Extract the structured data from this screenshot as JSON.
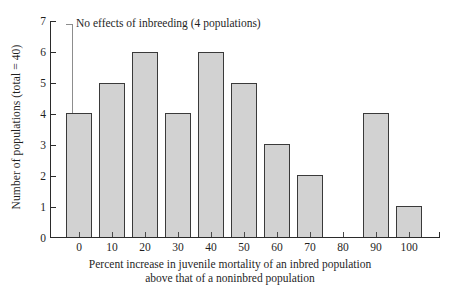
{
  "chart_data": {
    "type": "bar",
    "title": "",
    "subtitle": "",
    "xlabel_line1": "Percent increase in juvenile mortality of an inbred population",
    "xlabel_line2": "above that of a noninbred population",
    "ylabel": "Number of populations (total = 40)",
    "categories": [
      "0",
      "10",
      "20",
      "30",
      "40",
      "50",
      "60",
      "70",
      "80",
      "90",
      "100"
    ],
    "values": [
      4,
      5,
      6,
      4,
      6,
      5,
      3,
      2,
      0,
      4,
      1
    ],
    "xlim": [
      -5,
      105
    ],
    "ylim": [
      0,
      7
    ],
    "yticks": [
      "0",
      "1",
      "2",
      "3",
      "4",
      "5",
      "6",
      "7"
    ],
    "grid": false,
    "legend": false,
    "annotations": [
      {
        "text": "No effects of inbreeding (4 populations)",
        "points_to_category": "0",
        "points_to_value": 4
      }
    ],
    "colors": {
      "bar_fill": "#d2d2d2",
      "bar_stroke": "#3a3a3a",
      "axis": "#2b2b2b",
      "text": "#1f1f1f",
      "leader_line": "#8d8d8d",
      "background": "#ffffff"
    }
  }
}
